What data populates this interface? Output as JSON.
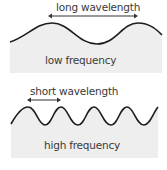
{
  "colors": {
    "wave_stroke": "#1e1e1e",
    "fill": "#eeeeee",
    "arrow": "#333333",
    "text": "#3a3a3a",
    "background": "#ffffff"
  },
  "panels": [
    {
      "wavelength_label": "long wavelength",
      "frequency_label": "low frequency"
    },
    {
      "wavelength_label": "short wavelength",
      "frequency_label": "high frequency"
    }
  ]
}
